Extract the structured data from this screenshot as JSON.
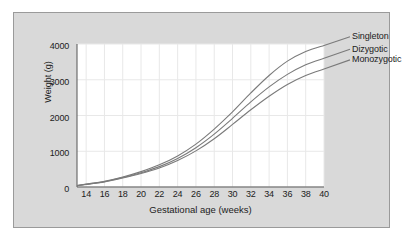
{
  "chart_data": {
    "type": "line",
    "title": "",
    "xlabel": "Gestational age (weeks)",
    "ylabel": "Weight (g)",
    "xlim": [
      13,
      40
    ],
    "ylim": [
      0,
      4000
    ],
    "xticks": [
      "14",
      "16",
      "18",
      "20",
      "22",
      "24",
      "26",
      "28",
      "30",
      "32",
      "34",
      "36",
      "38",
      "40"
    ],
    "xtick_values": [
      14,
      16,
      18,
      20,
      22,
      24,
      26,
      28,
      30,
      32,
      34,
      36,
      38,
      40
    ],
    "yticks": [
      "0",
      "1000",
      "2000",
      "3000",
      "4000"
    ],
    "ytick_values": [
      0,
      1000,
      2000,
      3000,
      4000
    ],
    "grid": true,
    "legend_position": "right-inline-labels",
    "x": [
      13,
      14,
      16,
      18,
      20,
      22,
      24,
      26,
      28,
      30,
      32,
      34,
      36,
      38,
      40
    ],
    "series": [
      {
        "name": "Singleton",
        "color": "#7a7a7a",
        "values": [
          40,
          80,
          160,
          280,
          430,
          620,
          870,
          1200,
          1620,
          2100,
          2630,
          3120,
          3520,
          3790,
          3960
        ]
      },
      {
        "name": "Dizygotic",
        "color": "#7a7a7a",
        "values": [
          38,
          75,
          150,
          265,
          400,
          570,
          800,
          1100,
          1480,
          1920,
          2380,
          2800,
          3150,
          3420,
          3600
        ]
      },
      {
        "name": "Monozygotic",
        "color": "#7a7a7a",
        "values": [
          36,
          72,
          142,
          250,
          375,
          530,
          740,
          1010,
          1350,
          1750,
          2160,
          2540,
          2870,
          3120,
          3300
        ]
      }
    ],
    "annotations": [
      {
        "text": "Singleton",
        "series": "Singleton"
      },
      {
        "text": "Dizygotic",
        "series": "Dizygotic"
      },
      {
        "text": "Monozygotic",
        "series": "Monozygotic"
      }
    ]
  },
  "style": {
    "figure_background": "#d9d9d9",
    "plot_background": "#ffffff",
    "grid_color": "#e8e8e8",
    "axis_color": "#555555",
    "text_color": "#1c1c1c",
    "line_color": "#7a7a7a"
  }
}
